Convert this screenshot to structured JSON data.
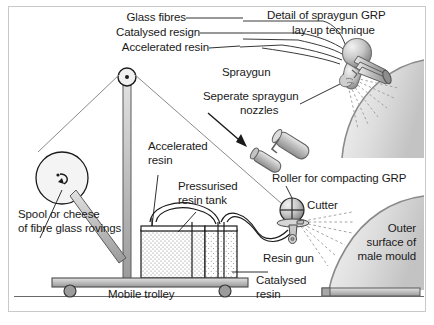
{
  "figure": {
    "background": "#ffffff",
    "border_color": "#c9c9c9",
    "ink_color": "#1a1a1a",
    "metal_fill": "#b8b8b8",
    "mould_fill": "#d8d8d8"
  },
  "labels": {
    "glass_fibres": "Glass fibres",
    "catalysed_resign": "Catalysed resign",
    "accelerated_resin_top": "Accelerated resin",
    "detail_line1": "Detail of spraygun GRP",
    "detail_line2": "lay-up technique",
    "spraygun": "Spraygun",
    "separate_nozzles_line1": "Seperate spraygun",
    "separate_nozzles_line2": "nozzles",
    "roller": "Roller for compacting GRP",
    "accelerated_resin_mid_line1": "Accelerated",
    "accelerated_resin_mid_line2": "resin",
    "pressurised_tank_line1": "Pressurised",
    "pressurised_tank_line2": "resin tank",
    "cutter": "Cutter",
    "spool_line1": "Spool or cheese",
    "spool_line2": "of fibre glass rovings",
    "resin_gun": "Resin gun",
    "catalysed_resin_line1": "Catalysed",
    "catalysed_resin_line2": "resin",
    "mobile_trolley": "Mobile trolley",
    "male_mould_line1": "Outer",
    "male_mould_line2": "surface of",
    "male_mould_line3": "male mould"
  },
  "parts": {
    "pulley": "pulley-wheel",
    "mast": "vertical-mast",
    "spool": "fibre-spool",
    "tank": "pressurised-resin-tank",
    "trolley": "mobile-trolley-base",
    "wheel_left": "trolley-wheel-left",
    "wheel_right": "trolley-wheel-right",
    "gun_head": "resin-gun-cutter-head",
    "mould_upper": "male-mould-upper-arc",
    "mould_lower": "male-mould-lower-arc",
    "mould_base": "male-mould-base-plate",
    "arrow": "detail-callout-arrow",
    "spray_upper": "spray-fan-upper",
    "spray_lower": "spray-fan-lower"
  }
}
